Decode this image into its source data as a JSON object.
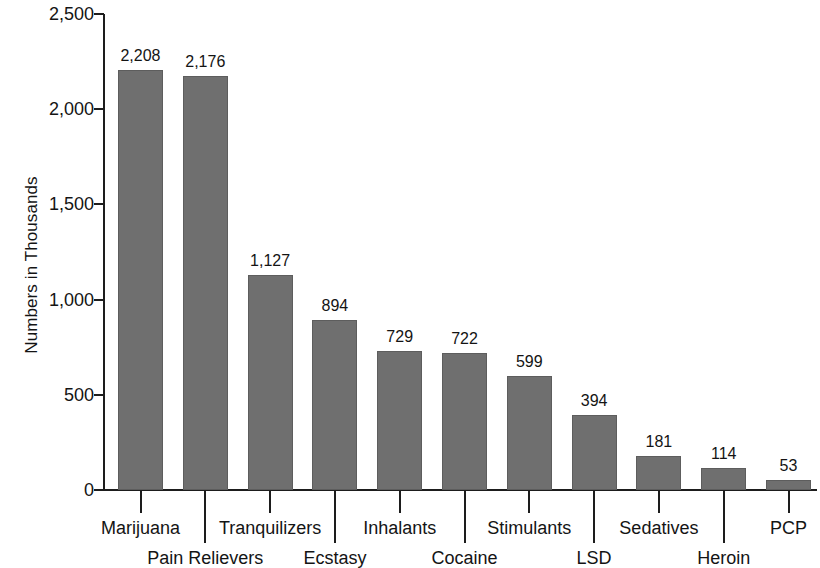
{
  "chart_data": {
    "type": "bar",
    "title": "",
    "xlabel": "",
    "ylabel": "Numbers in Thousands",
    "ylim": [
      0,
      2500
    ],
    "grid": false,
    "legend": "none",
    "orientation": "vertical",
    "bar_color": "#6f6f6f",
    "background_color": "#ffffff",
    "categories": [
      "Marijuana",
      "Pain Relievers",
      "Tranquilizers",
      "Ecstasy",
      "Inhalants",
      "Cocaine",
      "Stimulants",
      "LSD",
      "Sedatives",
      "Heroin",
      "PCP"
    ],
    "values": [
      2208,
      2176,
      1127,
      894,
      729,
      722,
      599,
      394,
      181,
      114,
      53
    ],
    "value_labels": [
      "2,208",
      "2,176",
      "1,127",
      "894",
      "729",
      "722",
      "599",
      "394",
      "181",
      "114",
      "53"
    ],
    "y_ticks": [
      0,
      500,
      1000,
      1500,
      2000,
      2500
    ],
    "y_tick_labels": [
      "0",
      "500",
      "1,000",
      "1,500",
      "2,000",
      "2,500"
    ],
    "x_label_rows": [
      1,
      0,
      1,
      0,
      1,
      0,
      1,
      0,
      1,
      0,
      1
    ]
  }
}
